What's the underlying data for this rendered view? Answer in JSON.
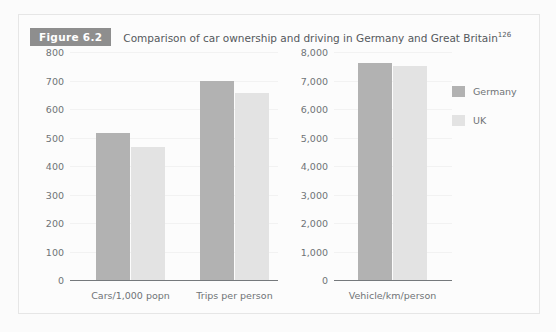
{
  "figure": {
    "badge": "Figure 6.2",
    "caption": "Comparison of car ownership and driving in Germany and Great Britain",
    "reference": "126"
  },
  "legend": {
    "items": [
      {
        "label": "Germany",
        "color": "#b2b2b2"
      },
      {
        "label": "UK",
        "color": "#e3e3e3"
      }
    ]
  },
  "chart_data": [
    {
      "type": "bar",
      "panel": "left",
      "title": "",
      "xlabel": "",
      "ylabel": "",
      "categories": [
        "Cars/1,000 popn",
        "Trips per person"
      ],
      "series": [
        {
          "name": "Germany",
          "color": "#b2b2b2",
          "values": [
            515,
            700
          ]
        },
        {
          "name": "UK",
          "color": "#e3e3e3",
          "values": [
            465,
            655
          ]
        }
      ],
      "ylim": [
        0,
        800
      ],
      "ytick_step": 100,
      "yticks": [
        "0",
        "100",
        "200",
        "300",
        "400",
        "500",
        "600",
        "700",
        "800"
      ],
      "ytick_values": [
        0,
        100,
        200,
        300,
        400,
        500,
        600,
        700,
        800
      ],
      "grid": true,
      "legend_position": "right"
    },
    {
      "type": "bar",
      "panel": "right",
      "title": "",
      "xlabel": "",
      "ylabel": "",
      "categories": [
        "Vehicle/km/person"
      ],
      "series": [
        {
          "name": "Germany",
          "color": "#b2b2b2",
          "values": [
            7600
          ]
        },
        {
          "name": "UK",
          "color": "#e3e3e3",
          "values": [
            7500
          ]
        }
      ],
      "ylim": [
        0,
        8000
      ],
      "ytick_step": 1000,
      "yticks": [
        "0",
        "1,000",
        "2,000",
        "3,000",
        "4,000",
        "5,000",
        "6,000",
        "7,000",
        "8,000"
      ],
      "ytick_values": [
        0,
        1000,
        2000,
        3000,
        4000,
        5000,
        6000,
        7000,
        8000
      ],
      "grid": true,
      "legend_position": "right"
    }
  ]
}
